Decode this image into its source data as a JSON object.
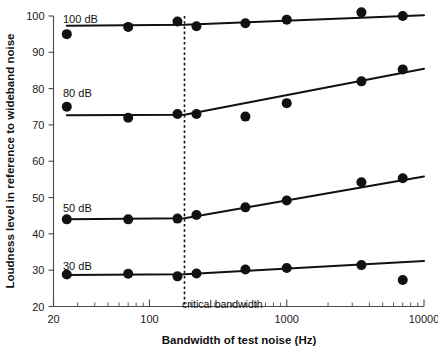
{
  "chart_data": {
    "type": "line",
    "title": "",
    "xlabel": "Bandwidth of test noise (Hz)",
    "ylabel": "Loudness level in reference to wideband noise",
    "xscale": "log",
    "xlim": [
      20,
      10000
    ],
    "ylim": [
      20,
      100
    ],
    "xticks": [
      20,
      100,
      1000,
      10000
    ],
    "xtick_labels": [
      "20",
      "100",
      "1000",
      "10000"
    ],
    "yticks": [
      20,
      30,
      40,
      50,
      60,
      70,
      80,
      90,
      100
    ],
    "ytick_labels": [
      "20",
      "30",
      "40",
      "50",
      "60",
      "70",
      "80",
      "90",
      "100"
    ],
    "grid": false,
    "legend": "inline-series-labels",
    "annotations": [
      {
        "name": "critical-bandwidth",
        "text": "critical bandwidth",
        "x": 180,
        "type": "vertical-dotted-line"
      }
    ],
    "series": [
      {
        "name": "100 dB",
        "label": "100 dB",
        "x": [
          25,
          70,
          160,
          220,
          500,
          1000,
          3500,
          7000
        ],
        "values": [
          95,
          97,
          98.5,
          97.2,
          98,
          99,
          101,
          100
        ],
        "fit_x": [
          25,
          180,
          10000
        ],
        "fit_y": [
          97.3,
          97.6,
          100.2
        ]
      },
      {
        "name": "80 dB",
        "label": "80 dB",
        "x": [
          25,
          70,
          160,
          220,
          500,
          1000,
          3500,
          7000
        ],
        "values": [
          75,
          72,
          73,
          73,
          72.3,
          76,
          82,
          85.3
        ],
        "fit_x": [
          25,
          180,
          10000
        ],
        "fit_y": [
          72.7,
          72.8,
          85.5
        ]
      },
      {
        "name": "50 dB",
        "label": "50 dB",
        "x": [
          25,
          70,
          160,
          220,
          500,
          1000,
          3500,
          7000
        ],
        "values": [
          44,
          44,
          44.2,
          45.2,
          47.3,
          49.2,
          54.2,
          55.3
        ],
        "fit_x": [
          25,
          180,
          10000
        ],
        "fit_y": [
          44.0,
          44.3,
          55.8
        ]
      },
      {
        "name": "30 dB",
        "label": "30 dB",
        "x": [
          25,
          70,
          160,
          220,
          500,
          1000,
          3500,
          7000
        ],
        "values": [
          28.8,
          29,
          28.3,
          29.1,
          30.2,
          30.6,
          31.4,
          27.3
        ],
        "fit_x": [
          25,
          180,
          10000
        ],
        "fit_y": [
          28.7,
          28.9,
          32.5
        ]
      }
    ]
  },
  "series_label_positions": [
    {
      "label": "100 dB",
      "x": 63,
      "y": 23
    },
    {
      "label": "80 dB",
      "x": 63,
      "y": 97
    },
    {
      "label": "50 dB",
      "x": 63,
      "y": 212
    },
    {
      "label": "30 dB",
      "x": 63,
      "y": 270
    }
  ],
  "annotation_positions": [
    {
      "text": "critical bandwidth",
      "x": 182,
      "y": 308
    }
  ]
}
